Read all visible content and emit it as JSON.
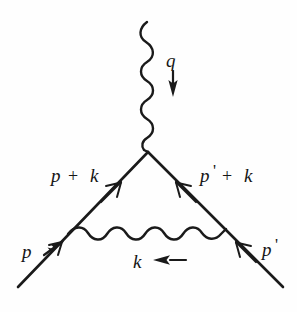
{
  "figure": {
    "kind": "feynman-diagram",
    "name": "QED vertex correction diagram",
    "background_color": "#fefefe",
    "ink_color": "#1a1a1a"
  },
  "labels": {
    "photon_external": {
      "symbol": "q",
      "arrow_direction": "down",
      "description": "external photon momentum label"
    },
    "fermion_upper_left": {
      "text": "p + k",
      "base": "p",
      "operator": "+",
      "addend": "k"
    },
    "fermion_upper_right": {
      "text": "p' + k",
      "base": "p",
      "prime": "'",
      "operator": "+",
      "addend": "k"
    },
    "fermion_incoming": {
      "symbol": "p"
    },
    "fermion_outgoing": {
      "symbol": "p",
      "prime": "'"
    },
    "photon_internal": {
      "symbol": "k",
      "arrow_direction": "left",
      "description": "loop photon momentum label"
    }
  },
  "geometry": {
    "vertex": {
      "x": 148,
      "y": 152
    },
    "photon_top_start": {
      "x": 148,
      "y": 22
    },
    "fermion_left_end": {
      "x": 18,
      "y": 287
    },
    "fermion_right_end": {
      "x": 283,
      "y": 287
    },
    "photon_loop_left": {
      "x": 68,
      "y": 233
    },
    "photon_loop_right": {
      "x": 226,
      "y": 228
    }
  }
}
